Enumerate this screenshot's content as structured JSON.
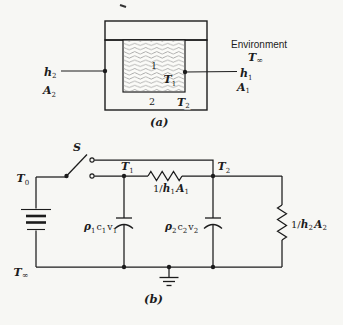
{
  "colors": {
    "ink": "#1c1c1c",
    "paper": "#f7f7f4",
    "wave": "#8f8f8f"
  },
  "a": {
    "caption": "(a)",
    "environment": "Environment",
    "t_inf": {
      "m": "T",
      "s": "∞"
    },
    "h1": {
      "m": "h",
      "s": "1"
    },
    "a1": {
      "m": "A",
      "s": "1"
    },
    "h2": {
      "m": "h",
      "s": "2"
    },
    "a2": {
      "m": "A",
      "s": "2"
    },
    "region1": "1",
    "region2": "2",
    "t1": {
      "m": "T",
      "s": "1"
    },
    "t2": {
      "m": "T",
      "s": "2"
    }
  },
  "b": {
    "caption": "(b)",
    "switch_label": "S",
    "t0": {
      "m": "T",
      "s": "0"
    },
    "t_inf": {
      "m": "T",
      "s": "∞"
    },
    "t1": {
      "m": "T",
      "s": "1"
    },
    "t2": {
      "m": "T",
      "s": "2"
    },
    "r1": {
      "pre": "1/",
      "h": "h",
      "hs": "1",
      "a": "A",
      "as": "1"
    },
    "r2": {
      "pre": "1/",
      "h": "h",
      "hs": "2",
      "a": "A",
      "as": "2"
    },
    "c1": {
      "rho": "ρ",
      "rs": "1",
      "c": "c",
      "cs": "1",
      "v": "v",
      "vs": "1"
    },
    "c2": {
      "rho": "ρ",
      "rs": "2",
      "c": "c",
      "cs": "2",
      "v": "v",
      "vs": "2"
    }
  }
}
